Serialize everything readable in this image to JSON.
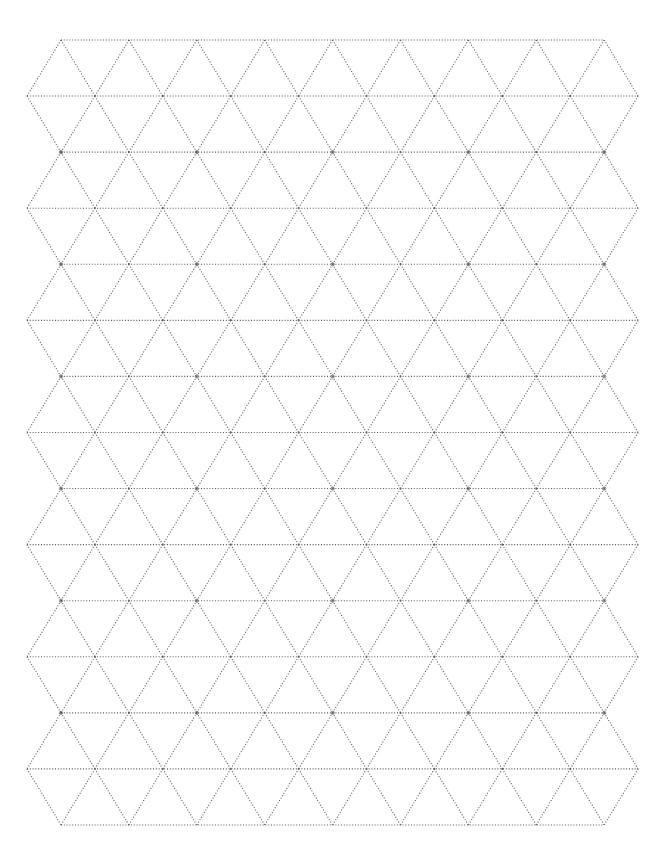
{
  "page": {
    "background": "#ffffff"
  },
  "grid": {
    "type": "triangular",
    "line_style": "dotted",
    "line_color": "#555555",
    "rows": 15,
    "row_spacing": 56.07,
    "top_y": 40,
    "even_row_start_x": 61,
    "odd_row_start_x": 27,
    "col_spacing": 67.9,
    "even_row_vertices": 9,
    "odd_row_vertices": 10
  }
}
